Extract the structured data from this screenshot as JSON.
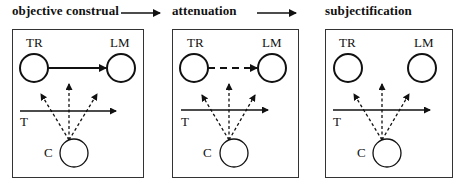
{
  "stages": [
    {
      "title": "objective construal",
      "tr": "TR",
      "lm": "LM",
      "t": "T",
      "c": "C",
      "tr_lm_link": "solid"
    },
    {
      "title": "attenuation",
      "tr": "TR",
      "lm": "LM",
      "t": "T",
      "c": "C",
      "tr_lm_link": "dashed"
    },
    {
      "title": "subjectification",
      "tr": "TR",
      "lm": "LM",
      "t": "T",
      "c": "C",
      "tr_lm_link": "none"
    }
  ],
  "transitions": [
    "arrow-right",
    "arrow-right"
  ],
  "colors": {
    "line": "#111111",
    "background": "#ffffff"
  }
}
